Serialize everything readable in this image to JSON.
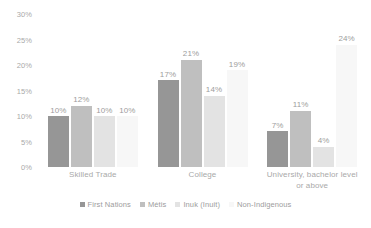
{
  "chart_data": {
    "type": "bar",
    "title": "",
    "subtitle": "",
    "xlabel": "",
    "ylabel": "",
    "ylim": [
      0,
      30
    ],
    "y_ticks": [
      "0%",
      "5%",
      "10%",
      "15%",
      "20%",
      "25%",
      "30%"
    ],
    "y_tick_values": [
      0,
      5,
      10,
      15,
      20,
      25,
      30
    ],
    "grid": false,
    "legend_position": "bottom",
    "value_suffix": "%",
    "categories": [
      "Skilled Trade",
      "College",
      "University,  bachelor level or above"
    ],
    "category_lines": [
      [
        "Skilled Trade"
      ],
      [
        "College"
      ],
      [
        "University,  bachelor level",
        "or above"
      ]
    ],
    "series": [
      {
        "name": "First Nations",
        "color": "#969696",
        "values": [
          10,
          17,
          7
        ],
        "labels": [
          "10%",
          "17%",
          "7%"
        ]
      },
      {
        "name": "Métis",
        "color": "#bfbfbf",
        "values": [
          12,
          21,
          11
        ],
        "labels": [
          "12%",
          "21%",
          "11%"
        ]
      },
      {
        "name": "Inuk (Inuit)",
        "color": "#e3e3e3",
        "values": [
          10,
          14,
          4
        ],
        "labels": [
          "10%",
          "14%",
          "4%"
        ]
      },
      {
        "name": "Non-Indigenous",
        "color": "#f7f7f7",
        "values": [
          10,
          19,
          24
        ],
        "labels": [
          "10%",
          "19%",
          "24%"
        ]
      }
    ]
  }
}
